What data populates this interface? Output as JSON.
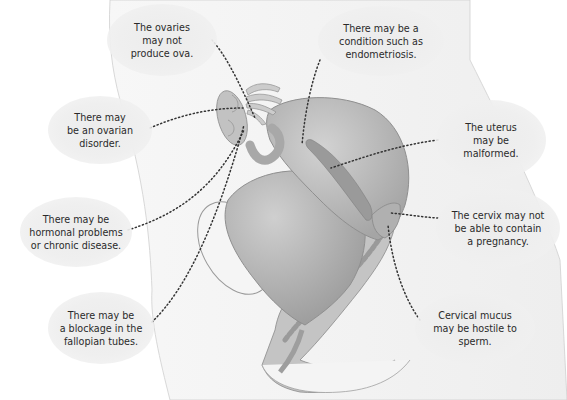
{
  "diagram": {
    "type": "anatomical-illustration",
    "labels": [
      {
        "id": "ovaries-ova",
        "text": "The ovaries\nmay not\nproduce ova."
      },
      {
        "id": "endometriosis",
        "text": "There may be a\ncondition such as\nendometriosis."
      },
      {
        "id": "ovarian-disorder",
        "text": "There may\nbe an ovarian\ndisorder."
      },
      {
        "id": "uterus-malformed",
        "text": "The uterus\nmay be\nmalformed."
      },
      {
        "id": "hormonal",
        "text": "There may be\nhormonal problems\nor chronic disease."
      },
      {
        "id": "cervix",
        "text": "The cervix may not\nbe able to contain\na pregnancy."
      },
      {
        "id": "fallopian-blockage",
        "text": "There may be\na blockage in the\nfallopian tubes."
      },
      {
        "id": "cervical-mucus",
        "text": "Cervical mucus\nmay be hostile to\nsperm."
      }
    ],
    "colors": {
      "background": "#ffffff",
      "body_silhouette": "#f2f2f2",
      "organ_fill": "#b8b8b8",
      "organ_dark": "#9a9a9a",
      "bubble": "#ececec",
      "leader_line": "#333333",
      "text": "#2a2a2a"
    }
  }
}
